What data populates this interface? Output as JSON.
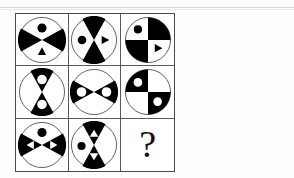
{
  "puzzle": {
    "type": "visual-analogy-matrix",
    "rows": 3,
    "columns": 3,
    "missing_cell_label": "?",
    "colors": {
      "ink": "#000000",
      "paper": "#ffffff",
      "grid_line": "#5a5a5a",
      "frame": "#4a4a4a",
      "scan_artifact": "#cfcfcb"
    },
    "cells": [
      {
        "id": "cell-1",
        "row": 1,
        "col": 1,
        "name": "circle-x-split-black-left-right-dot-top-triangle-bottom",
        "split": "diagonal-x",
        "black_wedges": [
          "left",
          "right"
        ],
        "white_wedges": [
          "top",
          "bottom"
        ],
        "marks": [
          {
            "shape": "circle",
            "color": "black",
            "wedge": "top"
          },
          {
            "shape": "triangle",
            "color": "black",
            "wedge": "bottom"
          }
        ]
      },
      {
        "id": "cell-2",
        "row": 1,
        "col": 2,
        "name": "circle-x-split-black-top-bottom-dot-left-triangle-right",
        "split": "diagonal-x",
        "black_wedges": [
          "top",
          "bottom"
        ],
        "white_wedges": [
          "left",
          "right"
        ],
        "marks": [
          {
            "shape": "circle",
            "color": "black",
            "wedge": "left"
          },
          {
            "shape": "triangle",
            "color": "black",
            "wedge": "right"
          }
        ]
      },
      {
        "id": "cell-3",
        "row": 1,
        "col": 3,
        "name": "circle-cross-split-black-topright-bottomleft-dot-topleft-triangle-bottomright",
        "split": "cross",
        "black_wedges": [
          "top-right",
          "bottom-left"
        ],
        "white_wedges": [
          "top-left",
          "bottom-right"
        ],
        "marks": [
          {
            "shape": "circle",
            "color": "black",
            "wedge": "top-left"
          },
          {
            "shape": "triangle",
            "color": "black",
            "wedge": "bottom-right"
          }
        ]
      },
      {
        "id": "cell-4",
        "row": 2,
        "col": 1,
        "name": "circle-x-split-black-top-bottom-white-dots",
        "split": "diagonal-x",
        "black_wedges": [
          "top",
          "bottom"
        ],
        "white_wedges": [
          "left",
          "right"
        ],
        "marks": [
          {
            "shape": "circle",
            "color": "white",
            "wedge": "top"
          },
          {
            "shape": "circle",
            "color": "white",
            "wedge": "bottom"
          }
        ]
      },
      {
        "id": "cell-5",
        "row": 2,
        "col": 2,
        "name": "circle-x-split-black-left-right-white-dots",
        "split": "diagonal-x",
        "black_wedges": [
          "left",
          "right"
        ],
        "white_wedges": [
          "top",
          "bottom"
        ],
        "marks": [
          {
            "shape": "circle",
            "color": "white",
            "wedge": "left"
          },
          {
            "shape": "circle",
            "color": "white",
            "wedge": "right"
          }
        ]
      },
      {
        "id": "cell-6",
        "row": 2,
        "col": 3,
        "name": "circle-cross-split-black-topleft-bottomright-white-dots",
        "split": "cross",
        "black_wedges": [
          "top-left",
          "bottom-right"
        ],
        "white_wedges": [
          "top-right",
          "bottom-left"
        ],
        "marks": [
          {
            "shape": "circle",
            "color": "white",
            "wedge": "top-left"
          },
          {
            "shape": "circle",
            "color": "white",
            "wedge": "bottom-right"
          }
        ]
      },
      {
        "id": "cell-7",
        "row": 3,
        "col": 1,
        "name": "circle-x-split-black-left-right-white-triangles-black-dot-top",
        "split": "diagonal-x",
        "black_wedges": [
          "left",
          "right"
        ],
        "white_wedges": [
          "top",
          "bottom"
        ],
        "marks": [
          {
            "shape": "triangle",
            "color": "white",
            "wedge": "left"
          },
          {
            "shape": "triangle",
            "color": "white",
            "wedge": "right"
          },
          {
            "shape": "circle",
            "color": "black",
            "wedge": "top"
          }
        ]
      },
      {
        "id": "cell-8",
        "row": 3,
        "col": 2,
        "name": "circle-x-split-black-top-bottom-white-triangles-black-dot-left",
        "split": "diagonal-x",
        "black_wedges": [
          "top",
          "bottom"
        ],
        "white_wedges": [
          "left",
          "right"
        ],
        "marks": [
          {
            "shape": "triangle",
            "color": "white",
            "wedge": "top"
          },
          {
            "shape": "triangle",
            "color": "white",
            "wedge": "bottom"
          },
          {
            "shape": "circle",
            "color": "black",
            "wedge": "left"
          }
        ]
      },
      {
        "id": "cell-9",
        "row": 3,
        "col": 3,
        "name": "missing-answer-cell",
        "split": "none",
        "black_wedges": [],
        "white_wedges": [],
        "marks": [],
        "label": "?"
      }
    ]
  }
}
